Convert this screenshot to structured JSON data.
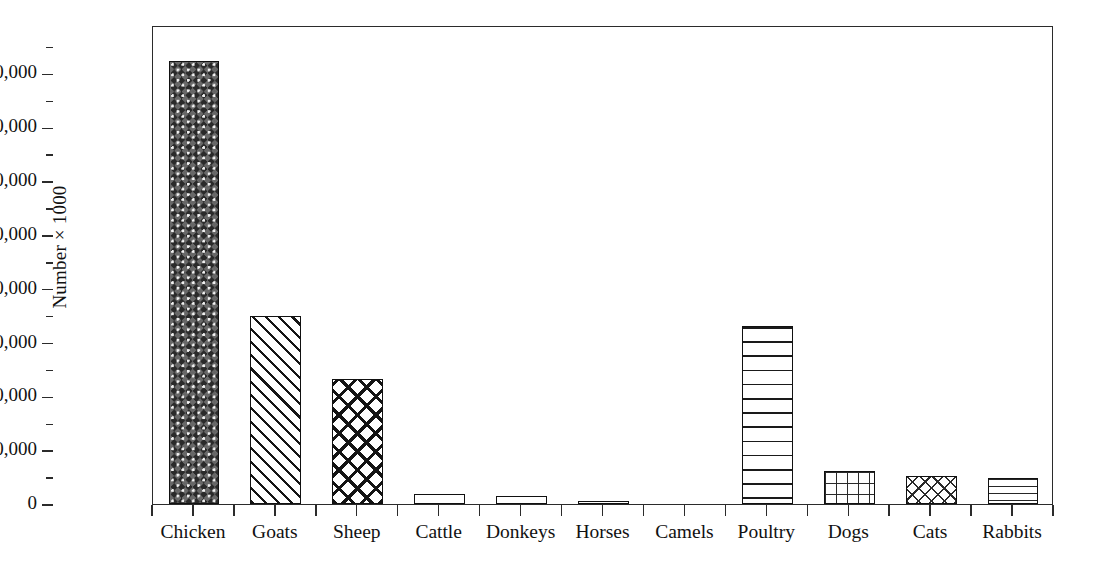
{
  "chart_data": {
    "type": "bar",
    "title": "",
    "subtitle": "",
    "xlabel": "",
    "ylabel": "Number × 1000",
    "categories": [
      "Chicken",
      "Goats",
      "Sheep",
      "Cattle",
      "Donkeys",
      "Horses",
      "Camels",
      "Poultry",
      "Dogs",
      "Cats",
      "Rabbits"
    ],
    "values": [
      82300,
      35000,
      23200,
      1800,
      1400,
      500,
      0,
      33100,
      6100,
      5200,
      4800
    ],
    "series": [
      {
        "name": "Livestock population",
        "values": [
          82300,
          35000,
          23200,
          1800,
          1400,
          500,
          0,
          33100,
          6100,
          5200,
          4800
        ]
      }
    ],
    "ylim": [
      0,
      89000
    ],
    "ytick_values": [
      0,
      10000,
      20000,
      30000,
      40000,
      50000,
      60000,
      70000,
      80000
    ],
    "ytick_labels": [
      "0",
      "10,000",
      "20,000",
      "30,000",
      "40,000",
      "50,000",
      "60,000",
      "70,000",
      "80,000"
    ],
    "yminor_values": [
      5000,
      15000,
      25000,
      35000,
      45000,
      55000,
      65000,
      75000,
      85000
    ],
    "grid": false,
    "legend": "none",
    "bar_patterns": [
      "pat-checker-dark",
      "pat-diag",
      "pat-crosshatch",
      "pat-plain",
      "pat-plain",
      "pat-plain",
      "pat-plain",
      "pat-hlines",
      "pat-grid",
      "pat-crosshatch-light",
      "pat-hlines-tight"
    ],
    "colors": {
      "axis": "#2b2b2b",
      "bar_outline": "#111111",
      "bar_fill": "#ffffff",
      "background": "#ffffff",
      "text": "#111111"
    }
  }
}
